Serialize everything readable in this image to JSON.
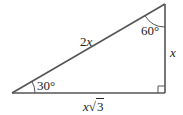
{
  "diagram": {
    "type": "right-triangle",
    "stroke_color": "#555555",
    "text_color": "#222222",
    "vertices": {
      "bottom_left": [
        12,
        93
      ],
      "top_right": [
        165,
        4
      ],
      "bottom_right": [
        165,
        93
      ]
    },
    "labels": {
      "hypotenuse": "2x",
      "hypotenuse_coef": "2",
      "hypotenuse_var": "x",
      "vertical_leg": "x",
      "horizontal_leg": "x√3",
      "horizontal_leg_var": "x",
      "horizontal_leg_sqrt_symbol": "√",
      "horizontal_leg_radicand": "3",
      "angle_bottom_left": "30°",
      "angle_top_right": "60°"
    },
    "right_angle_marker": true
  }
}
